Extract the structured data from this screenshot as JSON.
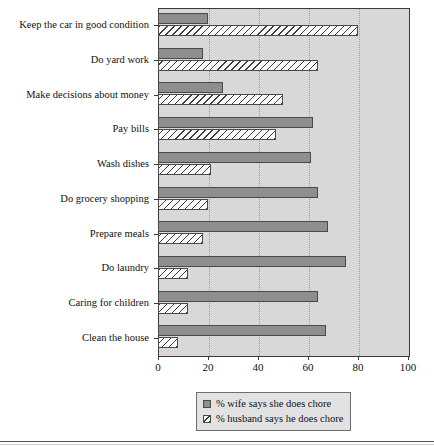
{
  "chart_data": {
    "type": "bar",
    "orientation": "horizontal",
    "title": "",
    "xlabel": "",
    "ylabel": "",
    "xlim": [
      0,
      100
    ],
    "xticks": [
      0,
      20,
      40,
      60,
      80,
      100
    ],
    "xticklabels": [
      "0",
      "20",
      "40",
      "60",
      "80",
      "100"
    ],
    "grid": "vertical-dotted",
    "legend_position": "bottom-center",
    "categories": [
      "Keep the car in good condition",
      "Do yard work",
      "Make decisions about money",
      "Pay bills",
      "Wash dishes",
      "Do grocery shopping",
      "Prepare meals",
      "Do laundry",
      "Caring for children",
      "Clean the house"
    ],
    "series": [
      {
        "name": "% wife says she does chore",
        "color": "#8e8e8e",
        "values": [
          20,
          18,
          26,
          62,
          61,
          64,
          68,
          75,
          64,
          67
        ]
      },
      {
        "name": "% husband says he does chore",
        "color": "#fafafa",
        "values": [
          80,
          64,
          50,
          47,
          21,
          20,
          18,
          12,
          12,
          8
        ]
      }
    ]
  },
  "legend": {
    "items": [
      {
        "label": "% wife says she does chore",
        "swatch": "wife-swatch"
      },
      {
        "label": "% husband says he does chore",
        "swatch": "husband-swatch"
      }
    ]
  },
  "colors": {
    "plot_background": "#d8d8d8",
    "frame": "#3a3a3a",
    "wife_bar": "#8e8e8e",
    "husband_bar": "#fafafa",
    "gridline": "#9a9a9a"
  }
}
